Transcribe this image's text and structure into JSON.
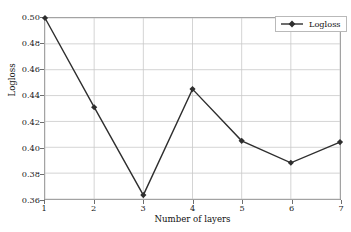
{
  "chart_data": {
    "type": "line",
    "title": "",
    "xlabel": "Number of layers",
    "ylabel": "Logloss",
    "x": [
      1,
      2,
      3,
      4,
      5,
      6,
      7
    ],
    "xticklabels": [
      "1",
      "2",
      "3",
      "4",
      "5",
      "6",
      "7"
    ],
    "xlim": [
      1,
      7
    ],
    "ylim": [
      0.36,
      0.5
    ],
    "yticks": [
      0.36,
      0.38,
      0.4,
      0.42,
      0.44,
      0.46,
      0.48,
      0.5
    ],
    "yticklabels": [
      "0.36",
      "0.38",
      "0.40",
      "0.42",
      "0.44",
      "0.46",
      "0.48",
      "0.50"
    ],
    "grid": true,
    "legend_position": "upper right",
    "series": [
      {
        "name": "Logloss",
        "marker": "diamond",
        "color": "#2e2e2e",
        "values": [
          0.5,
          0.431,
          0.363,
          0.445,
          0.405,
          0.388,
          0.404
        ]
      }
    ]
  },
  "style": {
    "line_color": "#2e2e2e",
    "marker_color": "#2e2e2e",
    "grid_color": "#c8c8c8",
    "frame_color": "#8a8a8a",
    "background": "#ffffff"
  },
  "legend": {
    "entries": [
      {
        "label": "Logloss"
      }
    ]
  }
}
